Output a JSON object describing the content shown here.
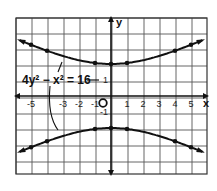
{
  "chart_data": {
    "type": "line",
    "title": "",
    "equation": "4y² − x² = 16",
    "xlabel": "x",
    "ylabel": "y",
    "xlim": [
      -6,
      6
    ],
    "ylim": [
      -4,
      4
    ],
    "grid": true,
    "x_tick_labels": [
      "-5",
      "-3",
      "-2",
      "-1",
      "1",
      "2",
      "3",
      "4",
      "5"
    ],
    "x_ticks": [
      -5,
      -3,
      -2,
      -1,
      1,
      2,
      3,
      4,
      5
    ],
    "y_tick_labels": [
      "1",
      "-1"
    ],
    "y_ticks": [
      1,
      -1
    ],
    "origin_label": "O",
    "series": [
      {
        "name": "upper branch",
        "x": [
          -5.5,
          -5,
          -4,
          -1,
          0,
          1,
          4,
          5,
          5.5
        ],
        "y": [
          3.4,
          3.2,
          2.83,
          2.06,
          2,
          2.06,
          2.83,
          3.2,
          3.4
        ],
        "marked_points_x": [
          -5,
          -4,
          -1,
          0,
          1,
          4,
          5
        ]
      },
      {
        "name": "lower branch",
        "x": [
          -5.5,
          -5,
          -4,
          -1,
          0,
          1,
          4,
          5,
          5.5
        ],
        "y": [
          -3.4,
          -3.2,
          -2.83,
          -2.06,
          -2,
          -2.06,
          -2.83,
          -3.2,
          -3.4
        ],
        "marked_points_x": [
          -5,
          -4,
          -1,
          0,
          1,
          4,
          5
        ]
      }
    ]
  }
}
